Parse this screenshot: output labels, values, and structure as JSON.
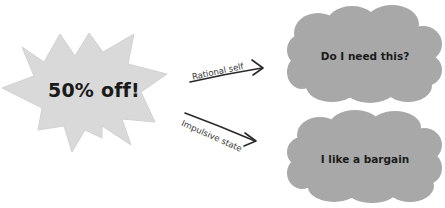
{
  "diagram": {
    "trigger": {
      "label": "50% off!",
      "shape": "starburst",
      "fill": "#d9d9d9"
    },
    "paths": [
      {
        "label": "Rational self",
        "target": "Do I need this?",
        "stroke": "#2a2a2a"
      },
      {
        "label": "Impulsive state",
        "target": "I like a bargain",
        "stroke": "#2a2a2a"
      }
    ],
    "outcomes": [
      {
        "label": "Do I need this?",
        "shape": "cloud",
        "fill": "#a8a8a8"
      },
      {
        "label": "I like a bargain",
        "shape": "cloud",
        "fill": "#a8a8a8"
      }
    ]
  }
}
